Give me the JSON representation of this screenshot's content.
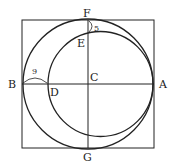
{
  "diagram": {
    "points": {
      "A": "A",
      "B": "B",
      "C": "C",
      "D": "D",
      "E": "E",
      "F": "F",
      "G": "G"
    },
    "measurements": {
      "BD": "9",
      "FE": "5"
    },
    "colors": {
      "stroke": "#222222",
      "background": "#ffffff"
    }
  }
}
